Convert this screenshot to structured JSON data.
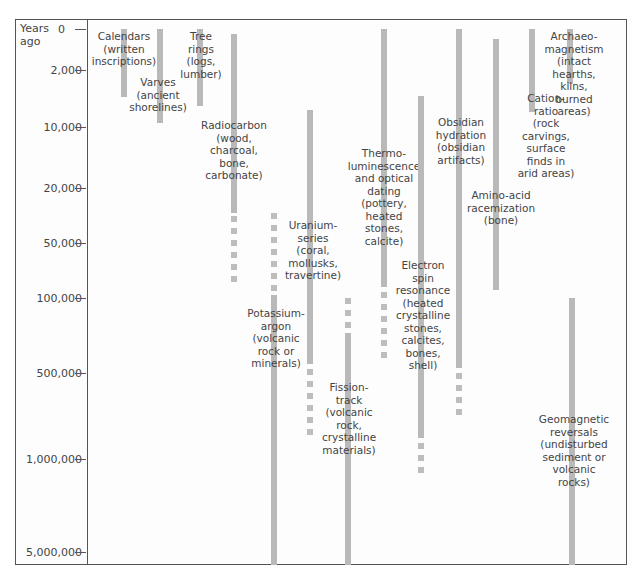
{
  "chart": {
    "axis_title": "Years\nago",
    "ticks": [
      {
        "label": "0",
        "y": 29
      },
      {
        "label": "2,000",
        "y": 70
      },
      {
        "label": "10,000",
        "y": 127
      },
      {
        "label": "20,000",
        "y": 188
      },
      {
        "label": "50,000",
        "y": 243
      },
      {
        "label": "100,000",
        "y": 298
      },
      {
        "label": "500,000",
        "y": 373
      },
      {
        "label": "1,000,000",
        "y": 459
      },
      {
        "label": "5,000,000",
        "y": 552
      }
    ],
    "methods": [
      {
        "name": "Calendars (written inscriptions)",
        "label": "Calendars\n(written\ninscriptions)",
        "x": 124,
        "bar": [
          29,
          97
        ],
        "dots": [],
        "lx": 124,
        "ly": 30
      },
      {
        "name": "Varves (ancient shorelines)",
        "label": "Varves\n(ancient\nshorelines)",
        "x": 160,
        "bar": [
          29,
          123
        ],
        "dots": [],
        "lx": 158,
        "ly": 76
      },
      {
        "name": "Tree rings (logs, lumber)",
        "label": "Tree\nrings\n(logs,\nlumber)",
        "x": 200,
        "bar": [
          29,
          106
        ],
        "dots": [],
        "lx": 201,
        "ly": 30
      },
      {
        "name": "Radiocarbon (wood, charcoal, bone, carbonate)",
        "label": "Radiocarbon\n(wood,\ncharcoal,\nbone,\ncarbonate)",
        "x": 234,
        "bar": [
          34,
          213
        ],
        "dots": [
          216,
          287
        ],
        "lx": 234,
        "ly": 119
      },
      {
        "name": "Uranium-series (coral, mollusks, travertine)",
        "label": "Uranium-\nseries\n(coral,\nmollusks,\ntravertine)",
        "x": 310,
        "bar": [
          110,
          364
        ],
        "dots": [
          369,
          440
        ],
        "lx": 313,
        "ly": 219
      },
      {
        "name": "Potassium-argon (volcanic rock or minerals)",
        "label": "Potassium-\nargon\n(volcanic\nrock or\nminerals)",
        "x": 274,
        "bar": [
          295,
          565
        ],
        "dots": [
          213,
          292
        ],
        "lx": 276,
        "ly": 307
      },
      {
        "name": "Fission-track (volcanic rock, crystalline materials)",
        "label": "Fission-\ntrack\n(volcanic\nrock,\ncrystalline\nmaterials)",
        "x": 348,
        "bar": [
          333,
          565
        ],
        "dots": [
          298,
          327
        ],
        "lx": 349,
        "ly": 381
      },
      {
        "name": "Thermoluminescence and optical dating (pottery, heated stones, calcite)",
        "label": "Thermo-\nluminescence\nand optical\ndating\n(pottery,\nheated\nstones,\ncalcite)",
        "x": 384,
        "bar": [
          29,
          287
        ],
        "dots": [
          292,
          358
        ],
        "lx": 384,
        "ly": 147
      },
      {
        "name": "Electron spin resonance (heated crystalline stones, calcites, bones, shell)",
        "label": "Electron\nspin\nresonance\n(heated\ncrystalline\nstones,\ncalcites,\nbones,\nshell)",
        "x": 421,
        "bar": [
          96,
          438
        ],
        "dots": [
          443,
          478
        ],
        "lx": 423,
        "ly": 259
      },
      {
        "name": "Obsidian hydration (obsidian artifacts)",
        "label": "Obsidian\nhydration\n(obsidian\nartifacts)",
        "x": 459,
        "bar": [
          29,
          368
        ],
        "dots": [
          373,
          415
        ],
        "lx": 461,
        "ly": 116
      },
      {
        "name": "Amino-acid racemization (bone)",
        "label": "Amino-acid\nracemization\n(bone)",
        "x": 496,
        "bar": [
          39,
          290
        ],
        "dots": [],
        "lx": 501,
        "ly": 189
      },
      {
        "name": "Cation-ratio (rock carvings, surface finds in arid areas)",
        "label": "Cation-\nratio\n(rock\ncarvings,\nsurface\nfinds in\narid areas)",
        "x": 532,
        "bar": [
          29,
          112
        ],
        "dots": [],
        "lx": 546,
        "ly": 92
      },
      {
        "name": "Archaeo-magnetism (intact hearths, kilns, burned areas)",
        "label": "Archaeo-\nmagnetism\n(intact\nhearths,\nkilns,\nburned\nareas)",
        "x": 570,
        "bar": [
          29,
          84
        ],
        "dots": [],
        "lx": 574,
        "ly": 30
      },
      {
        "name": "Geomagnetic reversals (undisturbed sediment or volcanic rocks)",
        "label": "Geomagnetic\nreversals\n(undisturbed\nsediment or\nvolcanic\nrocks)",
        "x": 572,
        "bar": [
          298,
          565
        ],
        "dots": [],
        "lx": 574,
        "ly": 413
      }
    ]
  },
  "colors": {
    "bar": "#b9b9b9",
    "frame": "#555555",
    "text": "#444444"
  },
  "chart_data": {
    "type": "table",
    "title": "",
    "ylabel": "Years ago",
    "y_ticks": [
      "0",
      "2,000",
      "10,000",
      "20,000",
      "50,000",
      "100,000",
      "500,000",
      "1,000,000",
      "5,000,000"
    ],
    "series": [
      {
        "name": "Calendars (written inscriptions)",
        "range_years_ago": [
          0,
          5000
        ],
        "extended": null
      },
      {
        "name": "Varves (ancient shorelines)",
        "range_years_ago": [
          0,
          12000
        ],
        "extended": null
      },
      {
        "name": "Tree rings (logs, lumber)",
        "range_years_ago": [
          0,
          9000
        ],
        "extended": null
      },
      {
        "name": "Radiocarbon (wood, charcoal, bone, carbonate)",
        "range_years_ago": [
          500,
          40000
        ],
        "extended": [
          40000,
          80000
        ]
      },
      {
        "name": "Uranium-series (coral, mollusks, travertine)",
        "range_years_ago": [
          10000,
          450000
        ],
        "extended": [
          450000,
          800000
        ]
      },
      {
        "name": "Potassium-argon (volcanic rock or minerals)",
        "range_years_ago": [
          100000,
          5000000
        ],
        "extended": [
          40000,
          100000
        ]
      },
      {
        "name": "Fission-track (volcanic rock, crystalline materials)",
        "range_years_ago": [
          250000,
          5000000
        ],
        "extended": [
          100000,
          250000
        ]
      },
      {
        "name": "Thermoluminescence and optical dating (pottery, heated stones, calcite)",
        "range_years_ago": [
          0,
          90000
        ],
        "extended": [
          90000,
          400000
        ]
      },
      {
        "name": "Electron spin resonance (heated crystalline stones, calcites, bones, shell)",
        "range_years_ago": [
          7000,
          900000
        ],
        "extended": [
          900000,
          1100000
        ]
      },
      {
        "name": "Obsidian hydration (obsidian artifacts)",
        "range_years_ago": [
          0,
          450000
        ],
        "extended": [
          450000,
          700000
        ]
      },
      {
        "name": "Amino-acid racemization (bone)",
        "range_years_ago": [
          1000,
          90000
        ],
        "extended": null
      },
      {
        "name": "Cation-ratio (rock carvings, surface finds in arid areas)",
        "range_years_ago": [
          0,
          13000
        ],
        "extended": null
      },
      {
        "name": "Archaeo-magnetism (intact hearths, kilns, burned areas)",
        "range_years_ago": [
          0,
          7000
        ],
        "extended": null
      },
      {
        "name": "Geomagnetic reversals (undisturbed sediment or volcanic rocks)",
        "range_years_ago": [
          100000,
          5000000
        ],
        "extended": null
      }
    ],
    "legend": "solid bar = established range; dotted = extended/uncertain range"
  }
}
